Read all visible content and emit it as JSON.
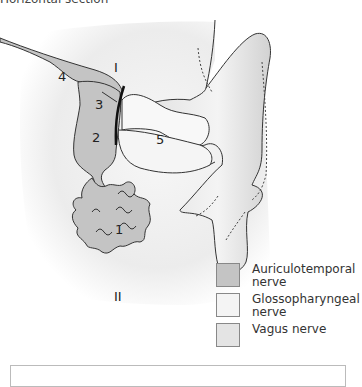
{
  "figure": {
    "title": "Horizontal section",
    "region_labels": [
      {
        "id": "1",
        "text": "I",
        "desc": "upper region label"
      },
      {
        "id": "4",
        "text": "4"
      },
      {
        "id": "3",
        "text": "3"
      },
      {
        "id": "2",
        "text": "2"
      },
      {
        "id": "5",
        "text": "5"
      },
      {
        "id": "1b",
        "text": "1"
      },
      {
        "id": "II",
        "text": "II"
      }
    ]
  },
  "legend": {
    "items": [
      {
        "label": "Auriculotemporal nerve",
        "color": "#c4c4c4"
      },
      {
        "label": "Glossopharyngeal nerve",
        "color": "#f4f4f4"
      },
      {
        "label": "Vagus nerve",
        "color": "#e4e4e4"
      }
    ]
  },
  "colors": {
    "outline": "#2a2a2a",
    "skin_shadow": "#d8d8d8",
    "dark_region": "#c4c4c4",
    "light_region": "#f6f6f6"
  }
}
